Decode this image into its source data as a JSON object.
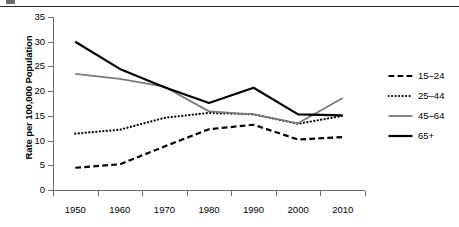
{
  "figure": {
    "has_top_rule": true,
    "background_color": "#ffffff"
  },
  "chart_data": {
    "type": "line",
    "title": "",
    "xlabel": "",
    "ylabel": "Rate per 100,000 Population",
    "x": [
      1950,
      1960,
      1970,
      1980,
      1990,
      2000,
      2010
    ],
    "xlim": [
      1945,
      2015
    ],
    "ylim": [
      0,
      35
    ],
    "ytick_labels": [
      "0",
      "5",
      "10",
      "15",
      "20",
      "25",
      "30",
      "35"
    ],
    "yticks": [
      0,
      5,
      10,
      15,
      20,
      25,
      30,
      35
    ],
    "xtick_labels": [
      "1950",
      "1960",
      "1970",
      "1980",
      "1990",
      "2000",
      "2010"
    ],
    "grid": false,
    "legend_position": "right",
    "series": [
      {
        "name": "15–24",
        "style": "dashed",
        "color": "#000000",
        "width": 2.2,
        "values": [
          4.5,
          5.2,
          8.8,
          12.3,
          13.2,
          10.2,
          10.7
        ]
      },
      {
        "name": "25–44",
        "style": "dotted",
        "color": "#000000",
        "width": 2.2,
        "values": [
          11.4,
          12.2,
          14.6,
          15.6,
          15.3,
          13.4,
          15.0
        ]
      },
      {
        "name": "45–64",
        "style": "solid",
        "color": "#7a7a7a",
        "width": 1.8,
        "values": [
          23.5,
          22.5,
          20.9,
          15.9,
          15.3,
          13.5,
          18.6
        ]
      },
      {
        "name": "65+",
        "style": "solid",
        "color": "#000000",
        "width": 2.2,
        "values": [
          30.0,
          24.5,
          20.8,
          17.6,
          20.7,
          15.3,
          15.1
        ]
      }
    ]
  },
  "legend": {
    "items": [
      {
        "label": "15–24",
        "icon": "dashed-line-swatch"
      },
      {
        "label": "25–44",
        "icon": "dotted-line-swatch"
      },
      {
        "label": "45–64",
        "icon": "gray-solid-line-swatch"
      },
      {
        "label": "65+",
        "icon": "black-solid-line-swatch"
      }
    ]
  }
}
